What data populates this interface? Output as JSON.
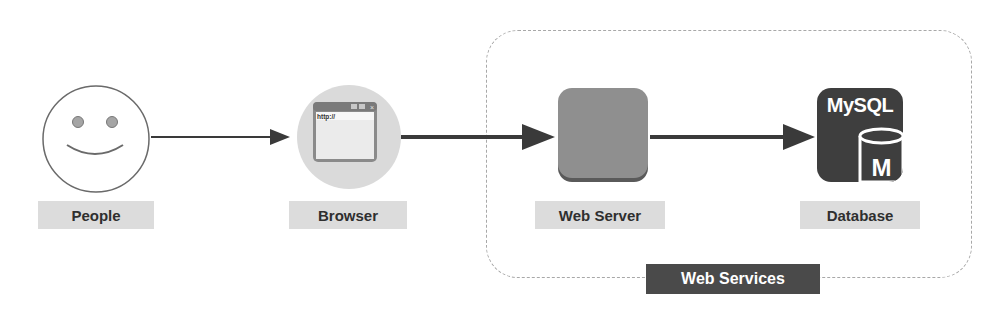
{
  "diagram": {
    "nodes": [
      {
        "id": "people",
        "label": "People",
        "icon": "smiley-face-icon"
      },
      {
        "id": "browser",
        "label": "Browser",
        "icon": "browser-window-icon",
        "url_text": "http://"
      },
      {
        "id": "web_server",
        "label": "Web Server",
        "icon": "server-block-icon"
      },
      {
        "id": "database",
        "label": "Database",
        "icon": "mysql-database-icon",
        "brand_text": "MySQL",
        "cylinder_text": "M"
      }
    ],
    "edges": [
      {
        "from": "people",
        "to": "browser"
      },
      {
        "from": "browser",
        "to": "web_server"
      },
      {
        "from": "web_server",
        "to": "database"
      }
    ],
    "group": {
      "label": "Web Services",
      "members": [
        "web_server",
        "database"
      ]
    }
  },
  "colors": {
    "arrow": "#3a3a3a",
    "label_bg": "#dcdcdc",
    "group_label_bg": "#4a4a4a",
    "server_fill": "#8f8f8f",
    "mysql_fill": "#3e3e3e",
    "dashed_border": "#a8a8a8"
  }
}
